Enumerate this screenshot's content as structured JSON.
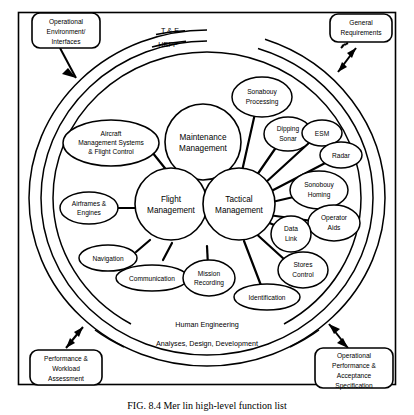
{
  "figure": {
    "caption": "FIG. 8.4  Mer lin high-level function list",
    "rings": [
      {
        "id": "te",
        "label": "T & E"
      },
      {
        "id": "hepp",
        "label": "HEPP"
      },
      {
        "id": "he",
        "label": "Human Engineering"
      },
      {
        "id": "add",
        "label": "Analyses, Design, Development"
      }
    ],
    "core_nodes": [
      {
        "id": "maintenance-management",
        "label_lines": [
          "Maintenance",
          "Management"
        ]
      },
      {
        "id": "flight-management",
        "label_lines": [
          "Flight",
          "Management"
        ]
      },
      {
        "id": "tactical-management",
        "label_lines": [
          "Tactical",
          "Management"
        ]
      }
    ],
    "satellite_nodes": [
      {
        "id": "aircraft-management-systems-flight-control",
        "label_lines": [
          "Aircraft",
          "Management Systems",
          "& Flight Control"
        ]
      },
      {
        "id": "airframes-engines",
        "label_lines": [
          "Airframes &",
          "Engines"
        ]
      },
      {
        "id": "navigation",
        "label_lines": [
          "Navigation"
        ]
      },
      {
        "id": "communication",
        "label_lines": [
          "Communication"
        ]
      },
      {
        "id": "mission-recording",
        "label_lines": [
          "Mission",
          "Recording"
        ]
      },
      {
        "id": "sonabouy-processing",
        "label_lines": [
          "Sonabouy",
          "Processing"
        ]
      },
      {
        "id": "dipping-sonar",
        "label_lines": [
          "Dipping",
          "Sonar"
        ]
      },
      {
        "id": "esm",
        "label_lines": [
          "ESM"
        ]
      },
      {
        "id": "radar",
        "label_lines": [
          "Radar"
        ]
      },
      {
        "id": "sonobouy-homing",
        "label_lines": [
          "Sonobouy",
          "Homing"
        ]
      },
      {
        "id": "operator-aids",
        "label_lines": [
          "Operator",
          "Aids"
        ]
      },
      {
        "id": "data-link",
        "label_lines": [
          "Data",
          "Link"
        ]
      },
      {
        "id": "stores-control",
        "label_lines": [
          "Stores",
          "Control"
        ]
      },
      {
        "id": "identification",
        "label_lines": [
          "Identification"
        ]
      }
    ],
    "corner_boxes": [
      {
        "id": "operational-environment-interfaces",
        "label_lines": [
          "Operational",
          "Environment/",
          "Interfaces"
        ]
      },
      {
        "id": "general-requirements",
        "label_lines": [
          "General",
          "Requirements"
        ]
      },
      {
        "id": "performance-workload-assessment",
        "label_lines": [
          "Performance &",
          "Workload",
          "Assessment"
        ]
      },
      {
        "id": "operational-performance-acceptance-specification",
        "label_lines": [
          "Operational",
          "Performance &",
          "Acceptance",
          "Specification"
        ]
      }
    ],
    "colors": {
      "stroke": "#000000",
      "fill": "#ffffff",
      "background": "#ffffff"
    }
  }
}
